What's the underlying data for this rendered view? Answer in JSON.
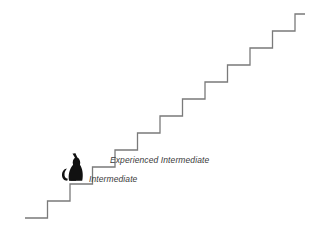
{
  "figure": {
    "type": "illustration",
    "background_color": "#ffffff",
    "line_color": "#7a7a7a",
    "silhouette_color": "#111111",
    "text_color": "#3a3a3a"
  },
  "staircase": {
    "name": "skill-progression-staircase",
    "step_count": 12,
    "step_width": 22.5,
    "step_height": 17,
    "start_x": 25,
    "start_y": 218,
    "end_x": 300,
    "end_y": 14,
    "path": "M 25 218 L 47.5 218 L 47.5 201 L 70 201 L 70 184 L 92.5 184 L 92.5 167 L 115 167 L 115 150 L 137.5 150 L 137.5 133 L 160 133 L 160 116 L 182.5 116 L 182.5 99 L 205 99 L 205 82 L 227.5 82 L 227.5 65 L 250 65 L 250 48 L 272.5 48 L 272.5 31 L 295 31 L 295 14 L 305 14"
  },
  "cat": {
    "name": "cat-silhouette",
    "description": "black sitting cat facing right with curled tail",
    "color": "#111111",
    "on_step_index": 3
  },
  "labels": [
    {
      "id": "intermediate",
      "text": "Intermediate",
      "step_index": 3
    },
    {
      "id": "experienced-intermediate",
      "text": "Experienced Intermediate",
      "step_index": 4
    }
  ]
}
